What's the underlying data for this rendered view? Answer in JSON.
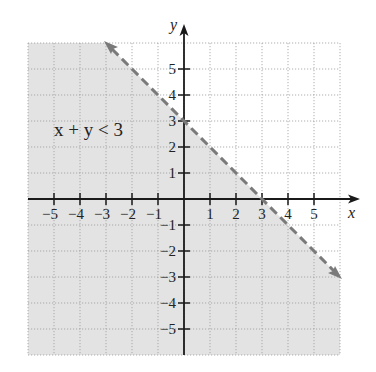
{
  "chart_data": {
    "type": "line",
    "title": "",
    "annotation": "x + y < 3",
    "xlabel": "x",
    "ylabel": "y",
    "xlim": [
      -6,
      6
    ],
    "ylim": [
      -6,
      6
    ],
    "grid": true,
    "grid_style": "dotted",
    "x_ticks": [
      -5,
      -4,
      -3,
      -2,
      -1,
      1,
      2,
      3,
      4,
      5
    ],
    "y_ticks": [
      -5,
      -4,
      -3,
      -2,
      -1,
      1,
      2,
      3,
      4,
      5
    ],
    "x_tick_labels": [
      "−5",
      "−4",
      "−3",
      "−2",
      "−1",
      "1",
      "2",
      "3",
      "4",
      "5"
    ],
    "y_tick_labels": [
      "−5",
      "−4",
      "−3",
      "−2",
      "−1",
      "1",
      "2",
      "3",
      "4",
      "5"
    ],
    "series": [
      {
        "name": "boundary x + y = 3",
        "style": "dashed",
        "color": "#7a7a7a",
        "x": [
          -3,
          6
        ],
        "y": [
          6,
          -3
        ],
        "arrows": "both"
      }
    ],
    "shaded_region": {
      "description": "half-plane below line x + y = 3",
      "inequality": "x + y < 3",
      "color": "#e3e3e3"
    }
  },
  "labels": {
    "x_axis": "x",
    "y_axis": "y",
    "inequality": "x + y < 3"
  }
}
